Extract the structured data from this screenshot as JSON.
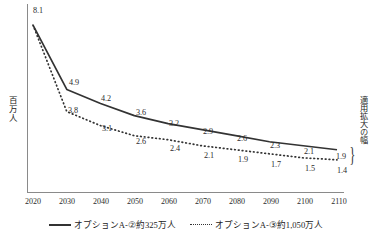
{
  "chart_data": {
    "type": "line",
    "title": "",
    "xlabel": "",
    "ylabel": "百万人",
    "categories": [
      "2020",
      "2030",
      "2040",
      "2050",
      "2060",
      "2070",
      "2080",
      "2090",
      "2100",
      "2110"
    ],
    "x": [
      2020,
      2030,
      2040,
      2050,
      2060,
      2070,
      2080,
      2090,
      2100,
      2110
    ],
    "xlim": [
      2020,
      2110
    ],
    "ylim": [
      0,
      8.6
    ],
    "grid": false,
    "legend_position": "bottom",
    "series": [
      {
        "name": "オプションA-②約325万人",
        "style": "solid",
        "color": "#333333",
        "values": [
          8.1,
          4.9,
          4.2,
          3.6,
          3.2,
          2.9,
          2.6,
          2.3,
          2.1,
          1.9
        ],
        "labels": [
          "8.1",
          "4.9",
          "4.2",
          "3.6",
          "3.2",
          "2.9",
          "2.6",
          "2.3",
          "2.1",
          "1.9"
        ]
      },
      {
        "name": "オプションA-③約1,050万人",
        "style": "dotted",
        "color": "#333333",
        "values": [
          8.1,
          3.8,
          3.1,
          2.6,
          2.4,
          2.1,
          1.9,
          1.7,
          1.5,
          1.4
        ],
        "labels": [
          "",
          "3.8",
          "3.1",
          "2.6",
          "2.4",
          "2.1",
          "1.9",
          "1.7",
          "1.5",
          "1.4"
        ]
      }
    ],
    "annotations": [
      {
        "name": "range-of-expansion",
        "text": "適用拡大の幅",
        "orientation": "vertical",
        "position": "right"
      }
    ]
  },
  "legend": {
    "items": [
      {
        "label": "オプションA-②約325万人",
        "style": "solid"
      },
      {
        "label": "オプションA-③約1,050万人",
        "style": "dotted"
      }
    ]
  },
  "axes": {
    "y_label": "百万人",
    "x_ticks": [
      "2020",
      "2030",
      "2040",
      "2050",
      "2060",
      "2070",
      "2080",
      "2090",
      "2100",
      "2110"
    ]
  },
  "annotation": {
    "brace": "}",
    "right_note": "適用拡大の幅"
  },
  "series_a_labels": {
    "p0": "8.1",
    "p1": "4.9",
    "p2": "4.2",
    "p3": "3.6",
    "p4": "3.2",
    "p5": "2.9",
    "p6": "2.6",
    "p7": "2.3",
    "p8": "2.1",
    "p9": "1.9"
  },
  "series_b_labels": {
    "p1": "3.8",
    "p2": "3.1",
    "p3": "2.6",
    "p4": "2.4",
    "p5": "2.1",
    "p6": "1.9",
    "p7": "1.7",
    "p8": "1.5",
    "p9": "1.4"
  }
}
